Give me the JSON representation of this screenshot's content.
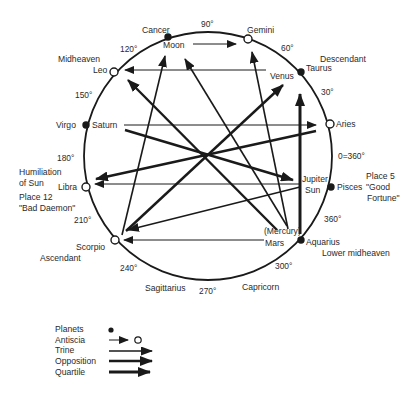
{
  "diagram": {
    "type": "astrological-chart",
    "circle": {
      "cx": 208,
      "cy": 155,
      "r": 124
    },
    "degree_labels": [
      "90°",
      "60°",
      "30°",
      "0=360°",
      "360°",
      "300°",
      "270°",
      "240°",
      "210°",
      "180°",
      "150°",
      "120°"
    ],
    "signs": {
      "cancer": "Cancer",
      "gemini": "Gemini",
      "taurus": "Taurus",
      "aries": "Aries",
      "pisces": "Pisces",
      "aquarius": "Aquarius",
      "capricorn": "Capricorn",
      "sagittarius": "Sagittarius",
      "scorpio": "Scorpio",
      "libra": "Libra",
      "virgo": "Virgo",
      "leo": "Leo"
    },
    "planets": {
      "moon": "Moon",
      "venus": "Venus",
      "saturn": "Saturn",
      "jupiter": "Jupiter",
      "sun": "Sun",
      "mercury": "(Mercury)",
      "mars": "Mars"
    },
    "annotations": {
      "midheaven": "Midheaven",
      "descendant": "Descendant",
      "humiliation_1": "Humiliation",
      "humiliation_2": "of Sun",
      "place12_1": "Place 12",
      "place12_2": "\"Bad Daemon\"",
      "ascendant": "Ascendant",
      "place5_1": "Place 5",
      "place5_2": "\"Good",
      "place5_3": "Fortune\"",
      "lower_midheaven": "Lower midheaven"
    },
    "connections": [
      {
        "from": "Moon",
        "to": "Gemini",
        "kind": "antiscia"
      },
      {
        "from": "Jupiter/Sun",
        "to": "Leo",
        "kind": "antiscia"
      },
      {
        "from": "Saturn",
        "to": "Aries",
        "kind": "antiscia"
      },
      {
        "from": "Jupiter/Sun",
        "to": "Libra",
        "kind": "antiscia"
      },
      {
        "from": "Mars",
        "to": "Scorpio",
        "kind": "antiscia"
      },
      {
        "from": "Scorpio",
        "to": "Moon",
        "kind": "trine"
      },
      {
        "from": "Mars",
        "to": "Gemini",
        "kind": "trine"
      },
      {
        "from": "Mercury",
        "to": "Moon",
        "kind": "trine"
      },
      {
        "from": "Jupiter/Sun",
        "to": "Scorpio",
        "kind": "trine"
      },
      {
        "from": "Mercury",
        "to": "Leo",
        "kind": "opposition"
      },
      {
        "from": "Saturn",
        "to": "Jupiter",
        "kind": "opposition"
      },
      {
        "from": "Scorpio",
        "to": "Venus",
        "kind": "opposition"
      },
      {
        "from": "Aries",
        "to": "Libra",
        "kind": "opposition"
      },
      {
        "from": "Mars",
        "to": "Taurus",
        "kind": "quartile"
      }
    ]
  },
  "legend": {
    "items": [
      {
        "label": "Planets",
        "symbol": "filled-dot"
      },
      {
        "label": "Antiscia",
        "symbol": "thin-arrow-open-circle"
      },
      {
        "label": "Trine",
        "symbol": "medium-arrow"
      },
      {
        "label": "Opposition",
        "symbol": "thick-arrow"
      },
      {
        "label": "Quartile",
        "symbol": "thickest-arrow"
      }
    ]
  },
  "colors": {
    "ink": "#1a1a1a",
    "text": "#2a2a2a",
    "background": "#ffffff"
  }
}
